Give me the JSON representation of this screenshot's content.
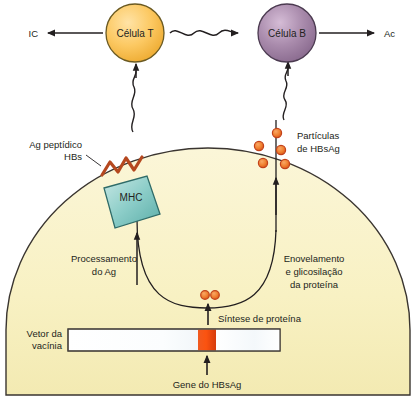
{
  "diagram": {
    "background_color": "#ffffff",
    "cell_fill": "#f7f0c0",
    "cell_stroke": "#3a3530",
    "line_color": "#231f20"
  },
  "top_row": {
    "left_output_label": "IC",
    "right_output_label": "Ac",
    "t_cell": {
      "label": "Célula T",
      "fill_light": "#fdd98a",
      "fill_dark": "#f2b33d",
      "stroke": "#6b5a22"
    },
    "b_cell": {
      "label": "Célula B",
      "fill_light": "#c8aac8",
      "fill_dark": "#8e6f92",
      "stroke": "#4b3a50"
    }
  },
  "mhc": {
    "label": "MHC",
    "fill_light": "#b7e0dd",
    "fill_dark": "#5fb3ae",
    "stroke": "#2f6b68"
  },
  "peptide": {
    "label_line1": "Ag peptídico",
    "label_line2": "HBs",
    "color": "#b5481f"
  },
  "particles": {
    "label_line1": "Partículas",
    "label_line2": "de HBsAg",
    "fill": "#f08030",
    "stroke": "#c2411a",
    "count": 5,
    "positions": [
      {
        "cx": 277,
        "cy": 133
      },
      {
        "cx": 260,
        "cy": 146
      },
      {
        "cx": 281,
        "cy": 150
      },
      {
        "cx": 264,
        "cy": 162
      },
      {
        "cx": 285,
        "cy": 164
      }
    ]
  },
  "ribosome": {
    "fill": "#f08030",
    "stroke": "#c2411a",
    "positions": [
      {
        "cx": 205,
        "cy": 295
      },
      {
        "cx": 215,
        "cy": 295
      }
    ]
  },
  "annotations": {
    "processing": {
      "line1": "Processamento",
      "line2": "do Ag"
    },
    "folding": {
      "line1": "Enovelamento",
      "line2": "e glicosilação",
      "line3": "da proteína"
    },
    "synthesis": "Síntese de proteína",
    "gene": "Gene do HBsAg",
    "vector": {
      "line1": "Vetor da",
      "line2": "vacínia"
    }
  },
  "vector_bar": {
    "fill_left": "#ffffff",
    "fill_mid": "#e8eef2",
    "gene_fill_light": "#f4481a",
    "gene_fill_dark": "#d93a10",
    "stroke": "#4a453f",
    "x": 68,
    "y": 329,
    "width": 212,
    "height": 22,
    "gene_offset": 130,
    "gene_width": 18
  }
}
